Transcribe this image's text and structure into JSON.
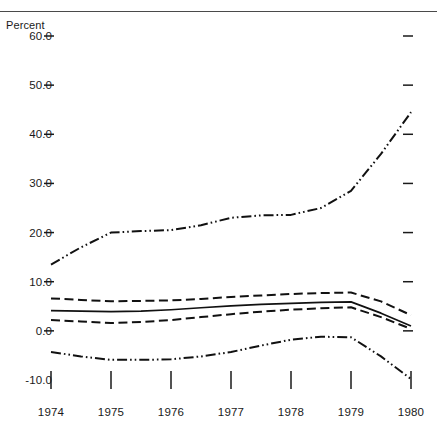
{
  "header": {
    "title_partial": "",
    "rule": "top-horizontal-rule"
  },
  "axis": {
    "unit_label": "Percent",
    "y_ticks": [
      "60.0",
      "50.0",
      "40.0",
      "30.0",
      "20.0",
      "10.0",
      "0.0",
      "-10.0"
    ],
    "y_values": [
      60,
      50,
      40,
      30,
      20,
      10,
      0,
      -10
    ],
    "x_ticks": [
      "1974",
      "1975",
      "1976",
      "1977",
      "1978",
      "1979",
      "1980"
    ],
    "x_values": [
      1974,
      1975,
      1976,
      1977,
      1978,
      1979,
      1980
    ]
  },
  "colors": {
    "ink": "#111111",
    "rule": "#4a4a4a",
    "background": "#ffffff"
  },
  "chart_data": {
    "type": "line",
    "title": "",
    "xlabel": "",
    "ylabel": "Percent",
    "ylim": [
      -10,
      60
    ],
    "xlim": [
      1974,
      1980
    ],
    "grid": false,
    "legend": "none",
    "ytick_labels": [
      "60.0",
      "50.0",
      "40.0",
      "30.0",
      "20.0",
      "10.0",
      "0.0",
      "-10.0"
    ],
    "xtick_labels": [
      "1974",
      "1975",
      "1976",
      "1977",
      "1978",
      "1979",
      "1980"
    ],
    "x": [
      1974,
      1974.5,
      1975,
      1975.5,
      1976,
      1976.5,
      1977,
      1977.5,
      1978,
      1978.5,
      1979,
      1979.5,
      1980
    ],
    "series": [
      {
        "name": "upper-rising-series",
        "style": "dash-dot-dot",
        "values": [
          13.5,
          17.0,
          20.0,
          20.3,
          20.5,
          21.5,
          23.0,
          23.5,
          23.6,
          25.0,
          28.5,
          36.0,
          44.5
        ]
      },
      {
        "name": "band-upper-series",
        "style": "dashed",
        "values": [
          6.6,
          6.3,
          6.0,
          6.1,
          6.2,
          6.5,
          6.9,
          7.2,
          7.5,
          7.7,
          7.8,
          6.0,
          3.2
        ]
      },
      {
        "name": "center-solid-series",
        "style": "solid",
        "values": [
          4.1,
          4.0,
          3.9,
          4.0,
          4.3,
          4.7,
          5.1,
          5.4,
          5.6,
          5.8,
          5.9,
          3.6,
          1.0
        ]
      },
      {
        "name": "band-lower-series",
        "style": "dashed",
        "values": [
          2.2,
          1.9,
          1.6,
          1.8,
          2.2,
          2.8,
          3.4,
          3.9,
          4.3,
          4.6,
          4.8,
          2.8,
          0.4
        ]
      },
      {
        "name": "lower-series",
        "style": "dash-dot-dot",
        "values": [
          -4.3,
          -5.2,
          -5.9,
          -5.9,
          -5.8,
          -5.2,
          -4.3,
          -3.0,
          -1.8,
          -1.2,
          -1.3,
          -5.2,
          -9.8
        ]
      }
    ]
  }
}
